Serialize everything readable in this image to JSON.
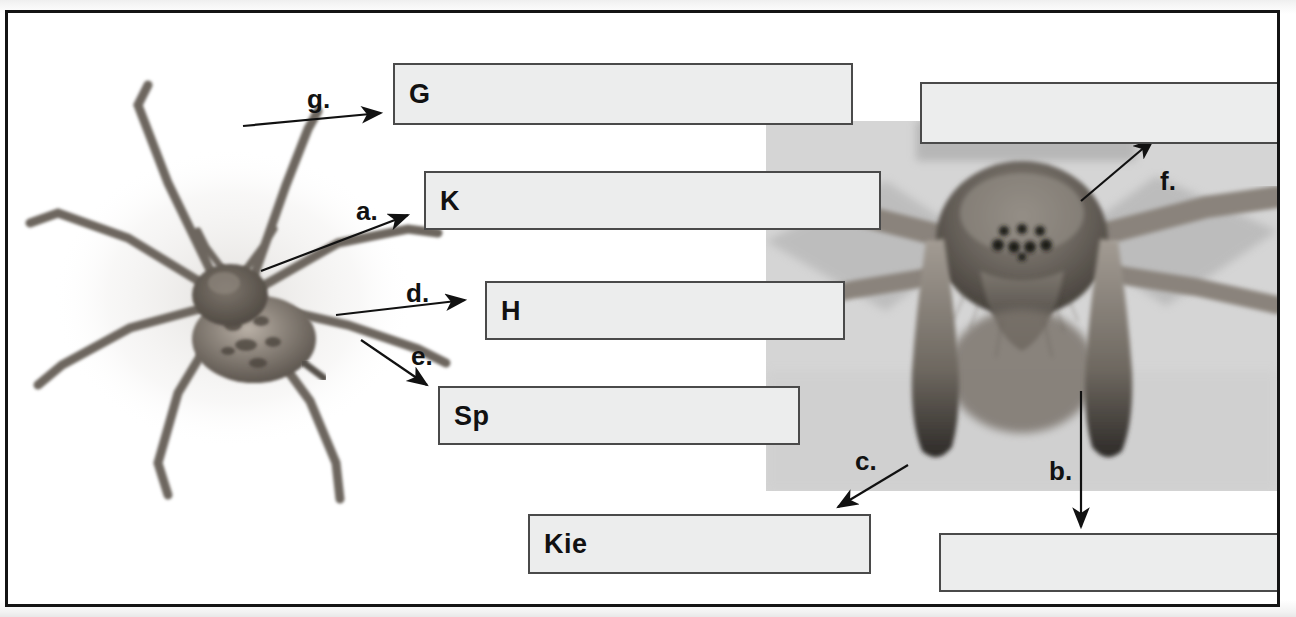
{
  "figure": {
    "frame_color": "#141414",
    "box_fill": "#eceded",
    "box_border": "#4a4a4a"
  },
  "photos": [
    {
      "id": "photo-left",
      "name": "spider-dorsal-photo",
      "caption": "dorsal view of a house spider (Tegenaria), eight legs spread"
    },
    {
      "id": "photo-right",
      "name": "spider-frontal-photo",
      "caption": "frontal close-up of spider head showing eyes, chelicerae and pedipalps"
    }
  ],
  "answer_boxes": [
    {
      "id": "box-g",
      "name": "answer-box-g",
      "letter": "G",
      "marker": "g."
    },
    {
      "id": "box-k",
      "name": "answer-box-k",
      "letter": "K",
      "marker": "a."
    },
    {
      "id": "box-h",
      "name": "answer-box-h",
      "letter": "H",
      "marker": "d."
    },
    {
      "id": "box-sp",
      "name": "answer-box-sp",
      "letter": "Sp",
      "marker": "e."
    },
    {
      "id": "box-kie",
      "name": "answer-box-kie",
      "letter": "Kie",
      "marker": "c."
    },
    {
      "id": "box-f",
      "name": "answer-box-f",
      "letter": "",
      "marker": "f."
    },
    {
      "id": "box-b",
      "name": "answer-box-b",
      "letter": "",
      "marker": "b."
    }
  ],
  "markers": {
    "a": "a.",
    "b": "b.",
    "c": "c.",
    "d": "d.",
    "e": "e.",
    "f": "f.",
    "g": "g."
  }
}
